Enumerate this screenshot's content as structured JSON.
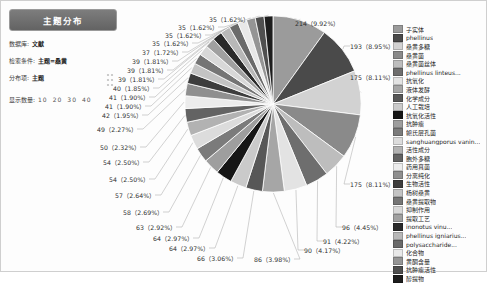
{
  "panel": {
    "title": "主题分布",
    "fields": [
      {
        "label": "数据库:",
        "value": "文献",
        "plain": false
      },
      {
        "label": "检索条件:",
        "value": "主题=桑黄",
        "plain": false
      },
      {
        "label": "分布项:",
        "value": "主题",
        "plain": false
      }
    ],
    "count_label": "显示数量:",
    "count_options": [
      "10",
      "20",
      "30",
      "40"
    ],
    "drag_handle_icon": "drag-handle-icon"
  },
  "chart_data": {
    "type": "pie",
    "title": "主题分布",
    "unit": "篇",
    "total": 2157,
    "legend_position": "right",
    "labels_format": "count (percent)",
    "categories": [
      "子实体",
      "phellinus",
      "桑黄多糖",
      "桑黄菌",
      "桑黄菌丝体",
      "phellinus linteus...",
      "抗氧化",
      "液体发酵",
      "化学成分",
      "人工栽培",
      "抗氧化活性",
      "抗肿瘤",
      "鲍氏层孔菌",
      "sanghuangporus vanin...",
      "活性成分",
      "胞外多糖",
      "药用真菌",
      "分离纯化",
      "生物活性",
      "杨树桑黄",
      "桑黄提取物",
      "抑制作用",
      "提取工艺",
      "inonotus vinu...",
      "phellinus igniarius...",
      "polysaccharide...",
      "化合物",
      "黄酮含量",
      "抗肿瘤活性",
      "醇提物"
    ],
    "values": [
      214,
      193,
      175,
      175,
      96,
      91,
      90,
      86,
      66,
      64,
      64,
      63,
      58,
      57,
      54,
      54,
      50,
      49,
      42,
      41,
      41,
      40,
      39,
      39,
      39,
      37,
      35,
      35,
      35,
      35
    ],
    "percents": [
      "9.92%",
      "8.95%",
      "8.11%",
      "8.11%",
      "4.45%",
      "4.22%",
      "4.17%",
      "3.98%",
      "3.06%",
      "2.97%",
      "2.97%",
      "2.92%",
      "2.69%",
      "2.64%",
      "2.50%",
      "2.50%",
      "2.32%",
      "2.27%",
      "1.95%",
      "1.90%",
      "1.90%",
      "1.85%",
      "1.81%",
      "1.81%",
      "1.81%",
      "1.72%",
      "1.62%",
      "1.62%",
      "1.62%",
      "1.62%"
    ],
    "colors": [
      "#9b9b9b",
      "#4a4a4a",
      "#d2d2d2",
      "#8a8a8a",
      "#bdbdbd",
      "#6e6e6e",
      "#e3e3e3",
      "#a6a6a6",
      "#575757",
      "#cacaca",
      "#161616",
      "#9e9e9e",
      "#7b7b7b",
      "#dcdcdc",
      "#b2b2b2",
      "#636363",
      "#ececec",
      "#8f8f8f",
      "#3d3d3d",
      "#c3c3c3",
      "#757575",
      "#d8d8d8",
      "#a0a0a0",
      "#2a2a2a",
      "#b8b8b8",
      "#6a6a6a",
      "#e8e8e8",
      "#959595",
      "#4f4f4f",
      "#1d1d1d"
    ],
    "callout_labels": [
      {
        "text": "214（9.92%）",
        "x": 294,
        "y": 18
      },
      {
        "text": "193（8.95%）",
        "x": 349,
        "y": 41
      },
      {
        "text": "175（8.11%）",
        "x": 349,
        "y": 72
      },
      {
        "text": "175（8.11%）",
        "x": 349,
        "y": 179
      },
      {
        "text": "96（4.45%）",
        "x": 341,
        "y": 222
      },
      {
        "text": "91（4.22%）",
        "x": 322,
        "y": 236
      },
      {
        "text": "90（4.17%）",
        "x": 303,
        "y": 245
      },
      {
        "text": "86（3.98%）",
        "x": 253,
        "y": 254
      },
      {
        "text": "66（3.06%）",
        "x": 196,
        "y": 253
      },
      {
        "text": "64（2.97%）",
        "x": 168,
        "y": 243
      },
      {
        "text": "64（2.97%）",
        "x": 152,
        "y": 233
      },
      {
        "text": "63（2.92%）",
        "x": 135,
        "y": 222
      },
      {
        "text": "58（2.69%）",
        "x": 122,
        "y": 207
      },
      {
        "text": "57（2.64%）",
        "x": 114,
        "y": 190
      },
      {
        "text": "54（2.50%）",
        "x": 108,
        "y": 174
      },
      {
        "text": "54（2.50%）",
        "x": 102,
        "y": 157
      },
      {
        "text": "50（2.32%）",
        "x": 99,
        "y": 142
      },
      {
        "text": "49（2.27%）",
        "x": 96,
        "y": 124
      },
      {
        "text": "42（1.95%）",
        "x": 101,
        "y": 110
      },
      {
        "text": "41（1.90%）",
        "x": 104,
        "y": 101
      },
      {
        "text": "41（1.90%）",
        "x": 108,
        "y": 92
      },
      {
        "text": "40（1.85%）",
        "x": 112,
        "y": 83
      },
      {
        "text": "39（1.81%）",
        "x": 117,
        "y": 74
      },
      {
        "text": "39（1.81%）",
        "x": 126,
        "y": 65
      },
      {
        "text": "39（1.81%）",
        "x": 131,
        "y": 56
      },
      {
        "text": "37（1.72%）",
        "x": 141,
        "y": 47
      },
      {
        "text": "35（1.62%）",
        "x": 151,
        "y": 38
      },
      {
        "text": "35（1.62%）",
        "x": 164,
        "y": 30
      },
      {
        "text": "35（1.62%）",
        "x": 177,
        "y": 22
      },
      {
        "text": "35（1.62%）",
        "x": 208,
        "y": 14
      }
    ]
  }
}
